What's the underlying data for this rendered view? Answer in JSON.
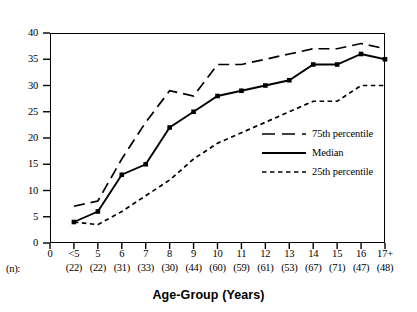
{
  "chart_data": {
    "type": "line",
    "title": "",
    "xlabel": "Age-Group (Years)",
    "ylabel": "",
    "ylim": [
      0,
      40
    ],
    "yticks": [
      0,
      5,
      10,
      15,
      20,
      25,
      30,
      35,
      40
    ],
    "grid": false,
    "legend_position": "inside-right",
    "categories": [
      "0",
      "<5",
      "5",
      "6",
      "7",
      "8",
      "9",
      "10",
      "11",
      "12",
      "13",
      "14",
      "15",
      "16",
      "17+"
    ],
    "n_label": "(n):",
    "n_values": [
      "",
      "(22)",
      "(22)",
      "(31)",
      "(33)",
      "(30)",
      "(44)",
      "(60)",
      "(59)",
      "(61)",
      "(53)",
      "(67)",
      "(71)",
      "(47)",
      "(48)"
    ],
    "series": [
      {
        "name": "75th percentile",
        "style": "long-dash",
        "markers": false,
        "values": [
          null,
          7,
          8,
          16,
          23,
          29,
          28,
          34,
          34,
          35,
          36,
          37,
          37,
          38,
          37
        ]
      },
      {
        "name": "Median",
        "style": "solid",
        "markers": true,
        "values": [
          null,
          4,
          6,
          13,
          15,
          22,
          25,
          28,
          29,
          30,
          31,
          34,
          34,
          36,
          35
        ]
      },
      {
        "name": "25th percentile",
        "style": "short-dash",
        "markers": false,
        "values": [
          null,
          4,
          3.5,
          6,
          9,
          12,
          16,
          19,
          21,
          23,
          25,
          27,
          27,
          30,
          30
        ]
      }
    ]
  },
  "legend": {
    "entries": [
      {
        "label": "75th percentile",
        "style": "long-dash"
      },
      {
        "label": "Median",
        "style": "solid"
      },
      {
        "label": "25th percentile",
        "style": "short-dash"
      }
    ]
  },
  "colors": {
    "line": "#000000",
    "axis": "#000000",
    "background": "#ffffff"
  }
}
